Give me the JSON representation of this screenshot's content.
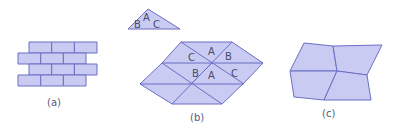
{
  "figure": {
    "colors": {
      "fill": "#c9cbf3",
      "stroke": "#6b6fc4",
      "text": "#4a4a6a"
    },
    "panels": [
      {
        "id": "a",
        "caption": "(a)",
        "description": "Brick-pattern tessellation of rectangles"
      },
      {
        "id": "b",
        "caption": "(b)",
        "description": "Tessellation of congruent triangles",
        "reference_triangle": {
          "angle_labels": [
            "A",
            "B",
            "C"
          ]
        },
        "tiling_labels": [
          "C",
          "A",
          "B",
          "B",
          "A",
          "C"
        ]
      },
      {
        "id": "c",
        "caption": "(c)",
        "description": "Tessellation of four congruent quadrilaterals"
      }
    ]
  }
}
